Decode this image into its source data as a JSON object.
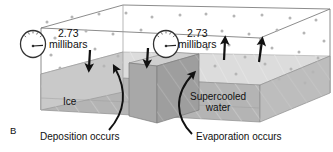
{
  "figure": {
    "panel_label": "B",
    "caption_type": "ice-water-vapor-equilibrium-diagram"
  },
  "gauges": [
    {
      "id": "left",
      "reading": "2.73",
      "unit": "millibars",
      "icon": "pressure-gauge-icon"
    },
    {
      "id": "right",
      "reading": "2.73",
      "unit": "millibars",
      "icon": "pressure-gauge-icon"
    }
  ],
  "regions": {
    "ice_label": "Ice",
    "water_label_line1": "Supercooled",
    "water_label_line2": "water"
  },
  "processes": [
    {
      "id": "deposition",
      "label": "Deposition occurs",
      "direction": "down"
    },
    {
      "id": "evaporation",
      "label": "Evaporation occurs",
      "direction": "up"
    }
  ],
  "colors": {
    "outline": "#5a5a5a",
    "top_surface": "#dcdcdc",
    "body_front": "#b4b4b4",
    "body_left": "#c9c9c9",
    "block_front": "#a8a8a8",
    "block_top": "#cfcfcf",
    "arrow": "#111111",
    "vapor_dot": "#b5b5b5",
    "text": "#111111"
  }
}
